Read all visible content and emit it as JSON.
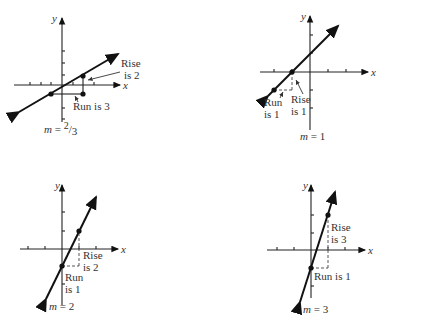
{
  "axis_labels": {
    "x": "x",
    "y": "y"
  },
  "panels": [
    {
      "id": "m-two-thirds",
      "slope_label_prefix": "m = ",
      "slope_num": "2",
      "slope_den": "3",
      "rise_label": [
        "Rise",
        "is 2"
      ],
      "run_label": "Run is 3",
      "rise": 2,
      "run": 3
    },
    {
      "id": "m-one",
      "slope_label": "m = 1",
      "rise_label": [
        "Rise",
        "is 1"
      ],
      "run_label": [
        "Run",
        "is 1"
      ],
      "rise": 1,
      "run": 1
    },
    {
      "id": "m-two",
      "slope_label": "m = 2",
      "rise_label": [
        "Rise",
        "is 2"
      ],
      "run_label": [
        "Run",
        "is 1"
      ],
      "rise": 2,
      "run": 1
    },
    {
      "id": "m-three",
      "slope_label": "m = 3",
      "rise_label": [
        "Rise",
        "is 3"
      ],
      "run_label": "Run is 1",
      "rise": 3,
      "run": 1
    }
  ]
}
